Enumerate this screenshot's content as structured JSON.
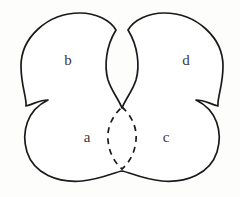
{
  "figure": {
    "type": "topological-region-diagram",
    "background_color": "#fdfdfc",
    "stroke_color": "#1a1a1a",
    "label_color": "#3a3a3a",
    "regions": [
      {
        "id": "region-b",
        "label": "b",
        "position": "top-left",
        "label_x": 67,
        "label_y": 60
      },
      {
        "id": "region-d",
        "label": "d",
        "position": "top-right",
        "label_x": 185,
        "label_y": 60
      },
      {
        "id": "region-a",
        "label": "a",
        "position": "bottom-left",
        "label_x": 86,
        "label_y": 137
      },
      {
        "id": "region-c",
        "label": "c",
        "position": "bottom-right",
        "label_x": 165,
        "label_y": 137
      }
    ],
    "overlap_curve": {
      "id": "central-lens",
      "style": "dashed",
      "shape": "lens",
      "center_x": 122,
      "center_y": 137,
      "half_width": 14,
      "half_height": 32
    },
    "outline": {
      "style": "solid",
      "stroke_width": 1.7,
      "fill": "#ffffff"
    }
  }
}
